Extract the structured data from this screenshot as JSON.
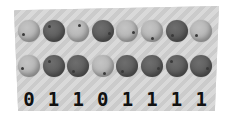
{
  "panel": {
    "background": "#d4d4d4",
    "texture": "diagonal-stripes"
  },
  "rows": {
    "top": [
      "light",
      "dark",
      "light",
      "dark",
      "light",
      "light",
      "dark",
      "light"
    ],
    "bottom": [
      "light",
      "dark",
      "dark",
      "light",
      "dark",
      "dark",
      "dark",
      "dark"
    ]
  },
  "digits": [
    "0",
    "1",
    "1",
    "0",
    "1",
    "1",
    "1",
    "1"
  ],
  "colors": {
    "light_bead": "#b4b4b4",
    "dark_bead": "#5a5a5a",
    "digit": "#111111"
  }
}
